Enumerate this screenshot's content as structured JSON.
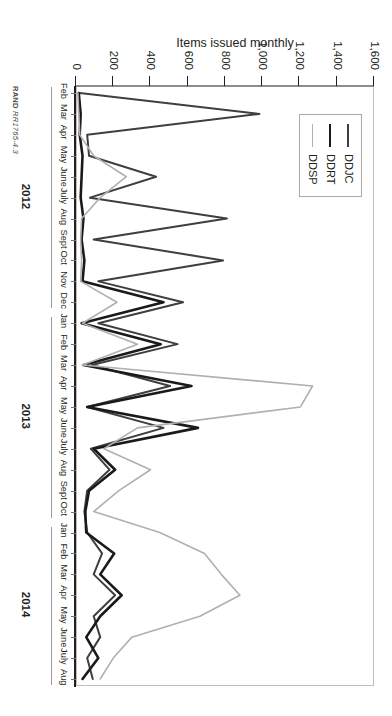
{
  "figure": {
    "credit_prefix": "RAND",
    "credit_id": "RR1765-4.3",
    "rotation_note": "90"
  },
  "legend": {
    "position": "top-left",
    "items": [
      {
        "label": "DDJC",
        "color": "#3f3f3f",
        "width": 2.0
      },
      {
        "label": "DDRT",
        "color": "#1a1a1a",
        "width": 2.6
      },
      {
        "label": "DDSP",
        "color": "#b0b0b0",
        "width": 1.6
      }
    ]
  },
  "axes": {
    "ylabel": "Items issued monthly",
    "yticks": [
      0,
      200,
      400,
      600,
      800,
      1000,
      1200,
      1400,
      1600
    ],
    "yticklabels": [
      "0",
      "200",
      "400",
      "600",
      "800",
      "1,000",
      "1,200",
      "1,400",
      "1,600"
    ],
    "ylim": [
      0,
      1600
    ],
    "xlabel": "",
    "grid": false
  },
  "chart_data": {
    "type": "line",
    "title": "",
    "subtitle": "",
    "xlabel": "",
    "ylabel": "Items issued monthly",
    "ylim": [
      0,
      1600
    ],
    "grid": false,
    "legend_position": "top-left",
    "annotations": [
      "RAND RR1765-4.3"
    ],
    "x": [
      "Feb 2012",
      "Mar 2012",
      "Apr 2012",
      "May 2012",
      "June 2012",
      "July 2012",
      "Aug 2012",
      "Sept 2012",
      "Oct 2012",
      "Nov 2012",
      "Dec 2012",
      "Jan 2013",
      "Feb 2013",
      "Mar 2013",
      "Apr 2013",
      "May 2013",
      "June 2013",
      "July 2013",
      "Aug 2013",
      "Sept 2013",
      "Oct 2013",
      "Jan 2014",
      "Feb 2014",
      "Mar 2014",
      "Apr 2014",
      "May 2014",
      "June 2014",
      "July 2014",
      "Aug 2014"
    ],
    "xticklabels": [
      "Feb",
      "Mar",
      "Apr",
      "May",
      "June",
      "July",
      "Aug",
      "Sept",
      "Oct",
      "Nov",
      "Dec",
      "Jan",
      "Feb",
      "Mar",
      "Apr",
      "May",
      "June",
      "July",
      "Aug",
      "Sept",
      "Oct",
      "Jan",
      "Feb",
      "Mar",
      "Apr",
      "May",
      "June",
      "July",
      "Aug"
    ],
    "year_groups": [
      {
        "label": "2012",
        "start_index": 0,
        "end_index": 10
      },
      {
        "label": "2013",
        "start_index": 11,
        "end_index": 20
      },
      {
        "label": "2014",
        "start_index": 21,
        "end_index": 28
      }
    ],
    "series": [
      {
        "name": "DDJC",
        "color": "#3f3f3f",
        "width": 2.0,
        "values": [
          20,
          985,
          60,
          70,
          430,
          75,
          810,
          95,
          790,
          120,
          575,
          120,
          545,
          85,
          505,
          60,
          470,
          80,
          180,
          60,
          45,
          60,
          140,
          95,
          210,
          95,
          130,
          60,
          90
        ]
      },
      {
        "name": "DDRT",
        "color": "#1a1a1a",
        "width": 2.6,
        "values": [
          15,
          25,
          20,
          35,
          30,
          25,
          40,
          30,
          45,
          35,
          470,
          30,
          455,
          40,
          620,
          60,
          655,
          95,
          210,
          70,
          50,
          55,
          205,
          130,
          245,
          130,
          55,
          120,
          35
        ]
      },
      {
        "name": "DDSP",
        "color": "#b0b0b0",
        "width": 1.6,
        "values": [
          10,
          15,
          20,
          95,
          270,
          130,
          30,
          25,
          30,
          25,
          220,
          35,
          330,
          35,
          1270,
          1205,
          330,
          150,
          400,
          230,
          95,
          450,
          690,
          780,
          880,
          665,
          300,
          200,
          130
        ]
      }
    ]
  }
}
